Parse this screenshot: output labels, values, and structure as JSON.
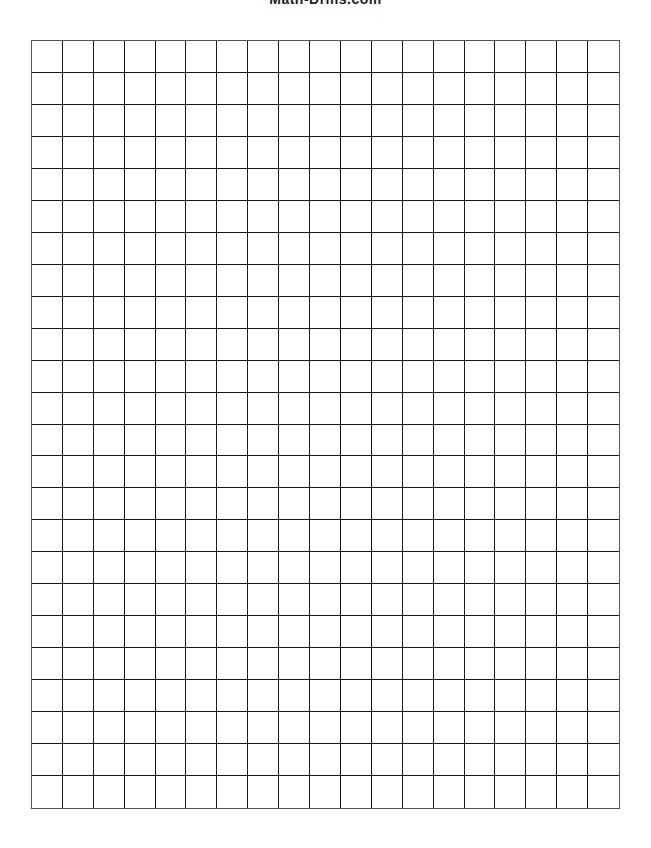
{
  "header": {
    "title": "Math-Drills.com"
  },
  "grid": {
    "columns": 19,
    "rows": 24,
    "line_color": "#1a1a1a",
    "border_color": "#555555",
    "background": "#ffffff"
  }
}
